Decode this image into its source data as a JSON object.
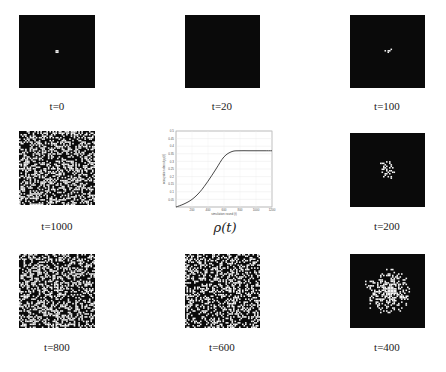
{
  "figure": {
    "panels": [
      {
        "id": "t0",
        "label": "t=0",
        "density": 0.0005,
        "spread": 0.02
      },
      {
        "id": "t20",
        "label": "t=20",
        "density": 0.01,
        "spread": 0.05
      },
      {
        "id": "t100",
        "label": "t=100",
        "density": 0.03,
        "spread": 0.1
      },
      {
        "id": "t1000",
        "label": "t=1000",
        "density": 0.37,
        "spread": 1.0
      },
      {
        "id": "t200",
        "label": "t=200",
        "density": 0.08,
        "spread": 0.22
      },
      {
        "id": "t800",
        "label": "t=800",
        "density": 0.37,
        "spread": 1.0
      },
      {
        "id": "t600",
        "label": "t=600",
        "density": 0.34,
        "spread": 0.95
      },
      {
        "id": "t400",
        "label": "t=400",
        "density": 0.2,
        "spread": 0.55
      }
    ],
    "rho_label": "ρ(t)"
  },
  "chart_data": {
    "type": "line",
    "title": "",
    "xlabel": "simulation round (t)",
    "ylabel": "occupation density ρ(t)",
    "xlim": [
      0,
      1200
    ],
    "ylim": [
      0,
      0.5
    ],
    "xticks": [
      200,
      400,
      600,
      800,
      1000,
      1200
    ],
    "yticks": [
      0.05,
      0.1,
      0.15,
      0.2,
      0.25,
      0.3,
      0.35,
      0.4,
      0.45,
      0.5
    ],
    "grid": true,
    "series": [
      {
        "name": "ρ(t)",
        "x": [
          0,
          100,
          200,
          300,
          400,
          500,
          600,
          700,
          800,
          900,
          1000,
          1100,
          1200
        ],
        "y": [
          0.0,
          0.02,
          0.05,
          0.1,
          0.17,
          0.25,
          0.33,
          0.365,
          0.37,
          0.37,
          0.37,
          0.37,
          0.37
        ]
      }
    ]
  }
}
